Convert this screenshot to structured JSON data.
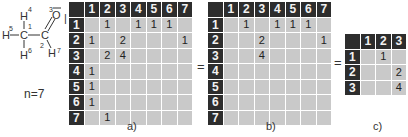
{
  "molecule": {
    "atoms": [
      {
        "symbol": "H",
        "index": "4"
      },
      {
        "symbol": "H",
        "index": "5"
      },
      {
        "symbol": "C",
        "index": "1"
      },
      {
        "symbol": "H",
        "index": "6"
      },
      {
        "symbol": "C",
        "index": "2"
      },
      {
        "symbol": "O",
        "index": "3"
      },
      {
        "symbol": "H",
        "index": "7"
      }
    ],
    "atom_count_label": "n=7"
  },
  "matrices": {
    "a": {
      "caption": "a)",
      "headers": [
        "1",
        "2",
        "3",
        "4",
        "5",
        "6",
        "7"
      ],
      "rows": [
        [
          "",
          "1",
          "",
          "1",
          "1",
          "1",
          ""
        ],
        [
          "1",
          "",
          "2",
          "",
          "",
          "",
          "1"
        ],
        [
          "",
          "2",
          "4",
          "",
          "",
          "",
          ""
        ],
        [
          "1",
          "",
          "",
          "",
          "",
          "",
          ""
        ],
        [
          "1",
          "",
          "",
          "",
          "",
          "",
          ""
        ],
        [
          "1",
          "",
          "",
          "",
          "",
          "",
          ""
        ],
        [
          "",
          "1",
          "",
          "",
          "",
          "",
          ""
        ]
      ]
    },
    "b": {
      "caption": "b)",
      "headers": [
        "1",
        "2",
        "3",
        "4",
        "5",
        "6",
        "7"
      ],
      "rows": [
        [
          "",
          "1",
          "",
          "1",
          "1",
          "1",
          ""
        ],
        [
          "",
          "",
          "2",
          "",
          "",
          "",
          "1"
        ],
        [
          "",
          "",
          "4",
          "",
          "",
          "",
          ""
        ],
        [
          "",
          "",
          "",
          "",
          "",
          "",
          ""
        ],
        [
          "",
          "",
          "",
          "",
          "",
          "",
          ""
        ],
        [
          "",
          "",
          "",
          "",
          "",
          "",
          ""
        ],
        [
          "",
          "",
          "",
          "",
          "",
          "",
          ""
        ]
      ]
    },
    "c": {
      "caption": "c)",
      "headers": [
        "1",
        "2",
        "3"
      ],
      "rows": [
        [
          "",
          "1",
          ""
        ],
        [
          "",
          "",
          "2"
        ],
        [
          "",
          "",
          "4"
        ]
      ]
    }
  },
  "operators": {
    "equals_1": "=",
    "equals_2": "="
  }
}
